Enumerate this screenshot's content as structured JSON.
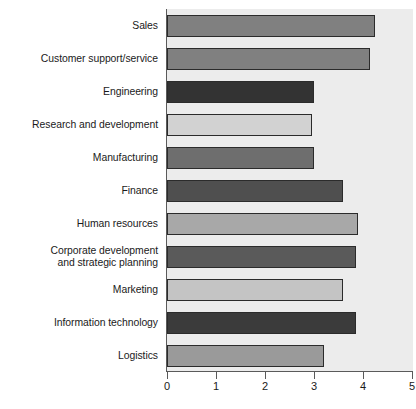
{
  "chart_data": {
    "type": "bar",
    "orientation": "horizontal",
    "title": "",
    "xlabel": "",
    "ylabel": "",
    "xlim": [
      0,
      5
    ],
    "grid": false,
    "legend": null,
    "xticks": [
      "0",
      "1",
      "2",
      "3",
      "4",
      "5"
    ],
    "categories": [
      "Sales",
      "Customer support/service",
      "Engineering",
      "Research and development",
      "Manufacturing",
      "Finance",
      "Human resources",
      "Corporate development and strategic planning",
      "Marketing",
      "Information technology",
      "Logistics"
    ],
    "values": [
      4.25,
      4.15,
      3.0,
      2.95,
      3.0,
      3.6,
      3.9,
      3.85,
      3.6,
      3.85,
      3.2
    ],
    "bars": [
      {
        "label": "Sales",
        "label_lines": [
          "Sales"
        ],
        "value": 4.25,
        "color": "#808080"
      },
      {
        "label": "Customer support/service",
        "label_lines": [
          "Customer support/service"
        ],
        "value": 4.15,
        "color": "#808080"
      },
      {
        "label": "Engineering",
        "label_lines": [
          "Engineering"
        ],
        "value": 3.0,
        "color": "#333333"
      },
      {
        "label": "Research and development",
        "label_lines": [
          "Research and development"
        ],
        "value": 2.95,
        "color": "#d2d2d2"
      },
      {
        "label": "Manufacturing",
        "label_lines": [
          "Manufacturing"
        ],
        "value": 3.0,
        "color": "#6e6e6e"
      },
      {
        "label": "Finance",
        "label_lines": [
          "Finance"
        ],
        "value": 3.6,
        "color": "#4f4f4f"
      },
      {
        "label": "Human resources",
        "label_lines": [
          "Human resources"
        ],
        "value": 3.9,
        "color": "#a8a8a8"
      },
      {
        "label": "Corporate development and strategic planning",
        "label_lines": [
          "Corporate development",
          "and strategic planning"
        ],
        "value": 3.85,
        "color": "#5a5a5a"
      },
      {
        "label": "Marketing",
        "label_lines": [
          "Marketing"
        ],
        "value": 3.6,
        "color": "#c4c4c4"
      },
      {
        "label": "Information technology",
        "label_lines": [
          "Information technology"
        ],
        "value": 3.85,
        "color": "#3b3b3b"
      },
      {
        "label": "Logistics",
        "label_lines": [
          "Logistics"
        ],
        "value": 3.2,
        "color": "#9a9a9a"
      }
    ],
    "colors": {
      "plot_background": "#ececec",
      "axis_line": "#5a5a5a",
      "bar_outline": "#2b2b2b",
      "text": "#1a1a1a"
    }
  }
}
